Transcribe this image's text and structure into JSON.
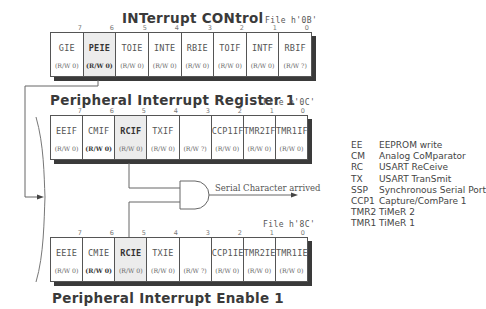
{
  "intcon": {
    "title": "INTerrupt  CONtrol",
    "file": "File h'0B'",
    "bit_numbers": [
      "7",
      "6",
      "5",
      "4",
      "3",
      "2",
      "1",
      "0"
    ],
    "cells": [
      {
        "name": "GIE",
        "access": "(R/W 0)",
        "highlight": false,
        "bold": false
      },
      {
        "name": "PEIE",
        "access": "(R/W 0)",
        "highlight": true,
        "bold": true
      },
      {
        "name": "TOIE",
        "access": "(R/W 0)",
        "highlight": false,
        "bold": false
      },
      {
        "name": "INTE",
        "access": "(R/W 0)",
        "highlight": false,
        "bold": false
      },
      {
        "name": "RBIE",
        "access": "(R/W 0)",
        "highlight": false,
        "bold": false
      },
      {
        "name": "TOIF",
        "access": "(R/W 0)",
        "highlight": false,
        "bold": false
      },
      {
        "name": "INTF",
        "access": "(R/W 0)",
        "highlight": false,
        "bold": false
      },
      {
        "name": "RBIF",
        "access": "(R/W ?)",
        "highlight": false,
        "bold": false
      }
    ]
  },
  "pir1": {
    "title": "Peripheral  Interrupt  Register 1",
    "file": "File h'0C'",
    "bit_numbers": [
      "7",
      "6",
      "5",
      "4",
      "3",
      "2",
      "1",
      "0"
    ],
    "cells": [
      {
        "name": "EEIF",
        "access": "(R/W 0)",
        "highlight": false,
        "bold": false
      },
      {
        "name": "CMIF",
        "access": "(R/W 0)",
        "highlight": false,
        "bold": false
      },
      {
        "name": "RCIF",
        "access": "(R/W 0)",
        "highlight": true,
        "bold": true
      },
      {
        "name": "TXIF",
        "access": "(R/W 0)",
        "highlight": false,
        "bold": false
      },
      {
        "name": "",
        "access": "(R/W ?)",
        "highlight": false,
        "bold": false
      },
      {
        "name": "CCP1IF",
        "access": "(R/W 0)",
        "highlight": false,
        "bold": false
      },
      {
        "name": "TMR2IF",
        "access": "(R/W 0)",
        "highlight": false,
        "bold": false
      },
      {
        "name": "TMR1IF",
        "access": "(R/W 0)",
        "highlight": false,
        "bold": false
      }
    ]
  },
  "pie1": {
    "title": "Peripheral  Interrupt  Enable 1",
    "file": "File h'8C'",
    "bit_numbers": [
      "7",
      "6",
      "5",
      "4",
      "3",
      "2",
      "1",
      "0"
    ],
    "cells": [
      {
        "name": "EEIE",
        "access": "(R/W 0)",
        "highlight": false,
        "bold": false
      },
      {
        "name": "CMIE",
        "access": "(R/W 0)",
        "highlight": false,
        "bold": false
      },
      {
        "name": "RCIE",
        "access": "(R/W 0)",
        "highlight": true,
        "bold": true
      },
      {
        "name": "TXIE",
        "access": "(R/W 0)",
        "highlight": false,
        "bold": false
      },
      {
        "name": "",
        "access": "(R/W ?)",
        "highlight": false,
        "bold": false
      },
      {
        "name": "CCP1IE",
        "access": "(R/W 0)",
        "highlight": false,
        "bold": false
      },
      {
        "name": "TMR2IE",
        "access": "(R/W 0)",
        "highlight": false,
        "bold": false
      },
      {
        "name": "TMR1IE",
        "access": "(R/W 0)",
        "highlight": false,
        "bold": false
      }
    ]
  },
  "gate": {
    "output_label": "Serial Character arrived"
  },
  "legend": [
    {
      "abbr": "EE",
      "text": "EEPROM write"
    },
    {
      "abbr": "CM",
      "text": "Analog CoMparator"
    },
    {
      "abbr": "RC",
      "text": "USART  ReCeive"
    },
    {
      "abbr": "TX",
      "text": "USART  TranSmit"
    },
    {
      "abbr": "SSP",
      "text": "Synchronous  Serial  Port"
    },
    {
      "abbr": "CCP1",
      "text": "Capture/ComPare 1"
    },
    {
      "abbr": "TMR2",
      "text": "TiMeR 2"
    },
    {
      "abbr": "TMR1",
      "text": "TiMeR 1"
    }
  ]
}
